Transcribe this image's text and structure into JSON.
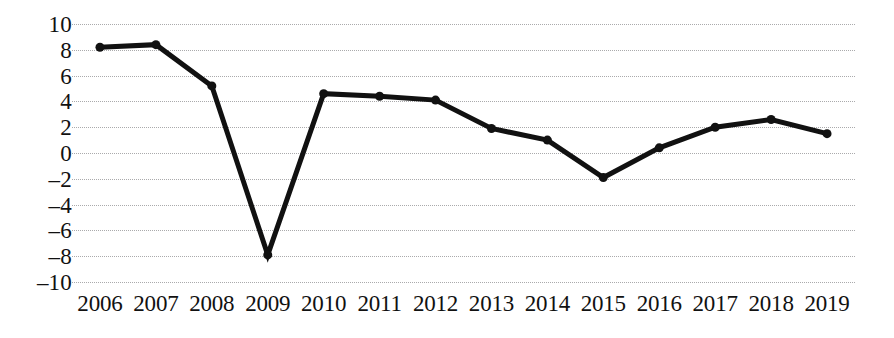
{
  "chart_data": {
    "type": "line",
    "title": "",
    "subtitle": "",
    "xlabel": "",
    "ylabel": "",
    "categories": [
      "2006",
      "2007",
      "2008",
      "2009",
      "2010",
      "2011",
      "2012",
      "2013",
      "2014",
      "2015",
      "2016",
      "2017",
      "2018",
      "2019"
    ],
    "values": [
      8.2,
      8.4,
      5.2,
      -7.9,
      4.6,
      4.4,
      4.1,
      1.9,
      1.0,
      -1.9,
      0.4,
      2.0,
      2.6,
      1.5
    ],
    "series": [
      {
        "name": "",
        "values": [
          8.2,
          8.4,
          5.2,
          -7.9,
          4.6,
          4.4,
          4.1,
          1.9,
          1.0,
          -1.9,
          0.4,
          2.0,
          2.6,
          1.5
        ]
      }
    ],
    "ylim": [
      -10,
      10
    ],
    "yticks": [
      10,
      8,
      6,
      4,
      2,
      0,
      -2,
      -4,
      -6,
      -8,
      -10
    ],
    "ytick_labels": [
      "10",
      "8",
      "6",
      "4",
      "2",
      "0",
      "–2",
      "–4",
      "–6",
      "–8",
      "–10"
    ],
    "xtick_labels": [
      "2006",
      "2007",
      "2008",
      "2009",
      "2010",
      "2011",
      "2012",
      "2013",
      "2014",
      "2015",
      "2016",
      "2017",
      "2018",
      "2019"
    ],
    "grid": true,
    "grid_axis": "y",
    "grid_style": "dotted",
    "grid_color": "#aaaaac",
    "legend": false,
    "legend_position": "none",
    "line_color": "#111111",
    "line_width": 5,
    "marker": "circle",
    "marker_color": "#111111",
    "marker_size": 9,
    "background_color": "#ffffff",
    "axis_lines": false
  }
}
